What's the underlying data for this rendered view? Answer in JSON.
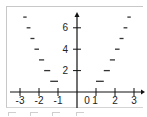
{
  "chart_data": {
    "type": "line",
    "title": "",
    "function": "y = floor(x^2)",
    "xlabel": "",
    "ylabel": "",
    "xlim": [
      -3.1,
      3.4
    ],
    "ylim": [
      -1.1,
      7.6
    ],
    "grid": false,
    "legend": null,
    "x_ticks": [
      -3,
      -2,
      -1,
      1,
      2,
      3
    ],
    "x_tick_labels": [
      "-3",
      "-2",
      "-1",
      "0",
      "1",
      "2",
      "3"
    ],
    "y_ticks": [
      2,
      4,
      6
    ],
    "y_tick_labels": [
      "2",
      "4",
      "6"
    ],
    "series": [
      {
        "name": "steps",
        "style": "horizontal segments",
        "segments": [
          {
            "y": 1,
            "x_left": [
              -1.41,
              -1.0
            ],
            "x_right": [
              1.0,
              1.41
            ]
          },
          {
            "y": 2,
            "x_left": [
              -1.73,
              -1.41
            ],
            "x_right": [
              1.41,
              1.73
            ]
          },
          {
            "y": 3,
            "x_left": [
              -2.0,
              -1.73
            ],
            "x_right": [
              1.73,
              2.0
            ]
          },
          {
            "y": 4,
            "x_left": [
              -2.24,
              -2.0
            ],
            "x_right": [
              2.0,
              2.24
            ]
          },
          {
            "y": 5,
            "x_left": [
              -2.45,
              -2.24
            ],
            "x_right": [
              2.24,
              2.45
            ]
          },
          {
            "y": 6,
            "x_left": [
              -2.65,
              -2.45
            ],
            "x_right": [
              2.45,
              2.65
            ]
          },
          {
            "y": 7,
            "x_left": [
              -2.83,
              -2.65
            ],
            "x_right": [
              2.65,
              2.83
            ]
          }
        ]
      }
    ]
  },
  "layout": {
    "origin_px": [
      77,
      92
    ],
    "x_unit_px": 19,
    "y_unit_px": 10.7,
    "axis_color": "#111111",
    "segment_color": "#333333",
    "label_color": "#222222"
  },
  "labels": {
    "x": [
      {
        "text": "-3",
        "x": -3
      },
      {
        "text": "-2",
        "x": -2
      },
      {
        "text": "-1",
        "x": -1
      },
      {
        "text": "0",
        "x": 0.53
      },
      {
        "text": "1",
        "x": 0.95
      },
      {
        "text": "2",
        "x": 2
      },
      {
        "text": "3",
        "x": 3
      }
    ],
    "y": [
      {
        "text": "2",
        "y": 2
      },
      {
        "text": "4",
        "y": 4
      },
      {
        "text": "6",
        "y": 6
      }
    ]
  }
}
